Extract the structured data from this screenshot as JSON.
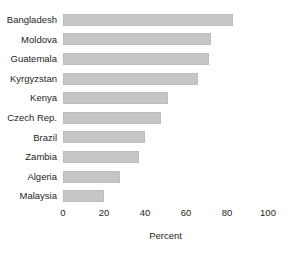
{
  "chart_data": {
    "type": "bar",
    "orientation": "horizontal",
    "title": "",
    "xlabel": "Percent",
    "ylabel": "",
    "categories": [
      "Bangladesh",
      "Moldova",
      "Guatemala",
      "Kyrgyzstan",
      "Kenya",
      "Czech Rep.",
      "Brazil",
      "Zambia",
      "Algeria",
      "Malaysia"
    ],
    "values": [
      83,
      72,
      71,
      66,
      51,
      48,
      40,
      37,
      28,
      20
    ],
    "xlim": [
      0,
      100
    ],
    "xticks": [
      0,
      20,
      40,
      60,
      80,
      100
    ],
    "xtick_labels": [
      "0",
      "20",
      "40",
      "60",
      "80",
      "100"
    ],
    "grid": false,
    "legend": null,
    "bar_color": "#c6c6c6",
    "bar_border_color": "#bdbdbd",
    "text_color": "#231f20"
  }
}
